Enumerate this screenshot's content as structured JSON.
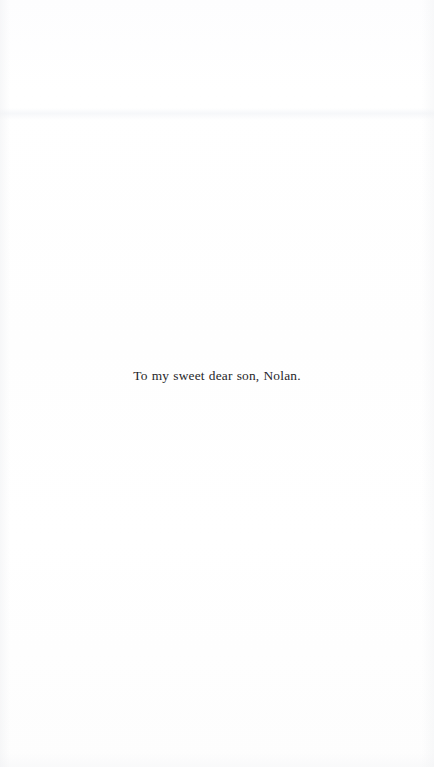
{
  "page": {
    "kind": "book-dedication-page",
    "background_color": "#fefefe",
    "width": 434,
    "height": 767
  },
  "dedication": {
    "text": "To my sweet dear son, Nolan.",
    "text_color": "#262629",
    "alignment": "center"
  }
}
